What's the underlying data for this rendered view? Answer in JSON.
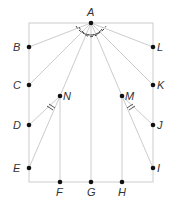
{
  "diagram": {
    "type": "geometry",
    "colors": {
      "line": "#cccccc",
      "point": "#111111",
      "label": "#333333",
      "arc": "#444444"
    },
    "points": {
      "A": {
        "x": 91,
        "y": 23,
        "label": "A",
        "lx": 87,
        "ly": 16
      },
      "B": {
        "x": 29,
        "y": 47,
        "label": "B",
        "lx": 13,
        "ly": 51
      },
      "C": {
        "x": 29,
        "y": 85,
        "label": "C",
        "lx": 13,
        "ly": 89
      },
      "D": {
        "x": 29,
        "y": 125,
        "label": "D",
        "lx": 13,
        "ly": 129
      },
      "E": {
        "x": 29,
        "y": 168,
        "label": "E",
        "lx": 13,
        "ly": 172
      },
      "F": {
        "x": 60,
        "y": 182,
        "label": "F",
        "lx": 56,
        "ly": 196
      },
      "G": {
        "x": 91,
        "y": 182,
        "label": "G",
        "lx": 87,
        "ly": 196
      },
      "H": {
        "x": 122,
        "y": 182,
        "label": "H",
        "lx": 118,
        "ly": 196
      },
      "I": {
        "x": 153,
        "y": 168,
        "label": "I",
        "lx": 157,
        "ly": 172
      },
      "J": {
        "x": 153,
        "y": 125,
        "label": "J",
        "lx": 157,
        "ly": 129
      },
      "K": {
        "x": 153,
        "y": 85,
        "label": "K",
        "lx": 157,
        "ly": 89
      },
      "L": {
        "x": 153,
        "y": 47,
        "label": "L",
        "lx": 157,
        "ly": 51
      },
      "M": {
        "x": 122,
        "y": 96,
        "label": "M",
        "lx": 125,
        "ly": 100
      },
      "N": {
        "x": 60,
        "y": 96,
        "label": "N",
        "lx": 63,
        "ly": 100
      }
    },
    "segments": [
      [
        "A",
        "B"
      ],
      [
        "A",
        "C"
      ],
      [
        "A",
        "N"
      ],
      [
        "A",
        "G"
      ],
      [
        "A",
        "M"
      ],
      [
        "A",
        "K"
      ],
      [
        "A",
        "L"
      ],
      [
        "N",
        "D"
      ],
      [
        "N",
        "E"
      ],
      [
        "N",
        "F"
      ],
      [
        "M",
        "J"
      ],
      [
        "M",
        "I"
      ],
      [
        "M",
        "H"
      ]
    ],
    "rectangle": {
      "x1": 29,
      "y1": 23,
      "x2": 153,
      "y2": 182
    },
    "angle_marks": "dashed arcs at A marking equal angles; double arc marks at N and M"
  }
}
